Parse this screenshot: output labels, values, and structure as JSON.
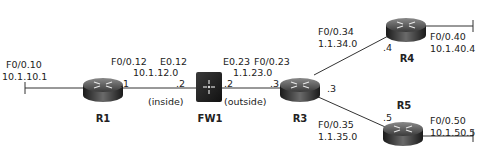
{
  "nodes": {
    "r1": {
      "name": "R1",
      "iface_left": "F0/0.10",
      "ip_left": "10.1.10.1",
      "host_right": ".1"
    },
    "fw1": {
      "name": "FW1",
      "iface_left": "E0.12",
      "iface_right": "E0.23",
      "host_left": ".2",
      "host_right": ".2",
      "zone_left": "(inside)",
      "zone_right": "(outside)"
    },
    "r3": {
      "name": "R3",
      "host_left": ".3",
      "host_right": ".3"
    },
    "r4": {
      "name": "R4",
      "host": ".4",
      "iface_right": "F0/0.40",
      "ip_right": "10.1.40.4"
    },
    "r5": {
      "name": "R5",
      "host": ".5",
      "iface_right": "F0/0.50",
      "ip_right": "10.1.50.5"
    }
  },
  "links": {
    "r1_fw1": {
      "iface": "F0/0.12",
      "subnet": "10.1.12.0"
    },
    "fw1_r3": {
      "iface": "F0/0.23",
      "subnet": "1.1.23.0"
    },
    "r3_r4": {
      "iface": "F0/0.34",
      "subnet": "1.1.34.0"
    },
    "r3_r5": {
      "iface": "F0/0.35",
      "subnet": "1.1.35.0"
    }
  }
}
